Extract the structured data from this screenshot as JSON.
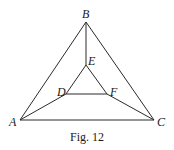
{
  "figure": {
    "caption": "Fig. 12",
    "points": {
      "A": {
        "label": "A",
        "x": 20,
        "y": 120
      },
      "B": {
        "label": "B",
        "x": 86,
        "y": 22
      },
      "C": {
        "label": "C",
        "x": 154,
        "y": 120
      },
      "D": {
        "label": "D",
        "x": 66,
        "y": 94
      },
      "E": {
        "label": "E",
        "x": 86,
        "y": 65
      },
      "F": {
        "label": "F",
        "x": 107,
        "y": 94
      }
    },
    "edges": [
      [
        "A",
        "B"
      ],
      [
        "B",
        "C"
      ],
      [
        "A",
        "C"
      ],
      [
        "D",
        "E"
      ],
      [
        "E",
        "F"
      ],
      [
        "D",
        "F"
      ],
      [
        "A",
        "D"
      ],
      [
        "B",
        "E"
      ],
      [
        "C",
        "F"
      ]
    ],
    "colors": {
      "line": "#2a2a2a",
      "text": "#1a1a1a",
      "background": "#ffffff"
    }
  }
}
